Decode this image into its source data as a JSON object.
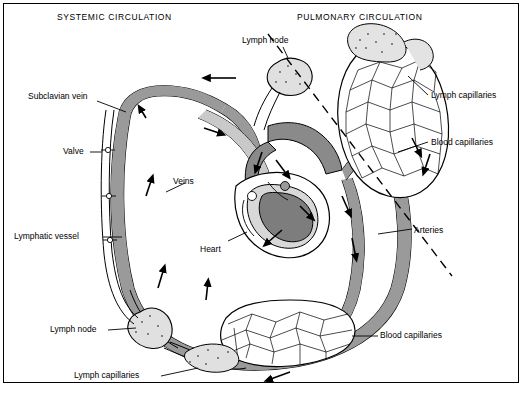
{
  "figure": {
    "title_left": "SYSTEMIC CIRCULATION",
    "title_right": "PULMONARY CIRCULATION"
  },
  "labels": {
    "subclavian_vein": "Subclavian vein",
    "valve": "Valve",
    "veins": "Veins",
    "lymphatic_vessel": "Lymphatic vessel",
    "heart": "Heart",
    "lymph_node_top": "Lymph node",
    "lymph_node_left": "Lymph node",
    "lymph_capillaries_right": "Lymph capillaries",
    "lymph_capillaries_bottom": "Lymph capillaries",
    "blood_capillaries_right": "Blood capillaries",
    "blood_capillaries_bottom": "Blood  capillaries",
    "arteries": "Arteries"
  },
  "colors": {
    "vessel_fill": "#9a9a9a",
    "capillary_fill": "#d0d0d0",
    "outline": "#000000",
    "background": "#ffffff",
    "heart_dark": "#6e6e6e"
  }
}
